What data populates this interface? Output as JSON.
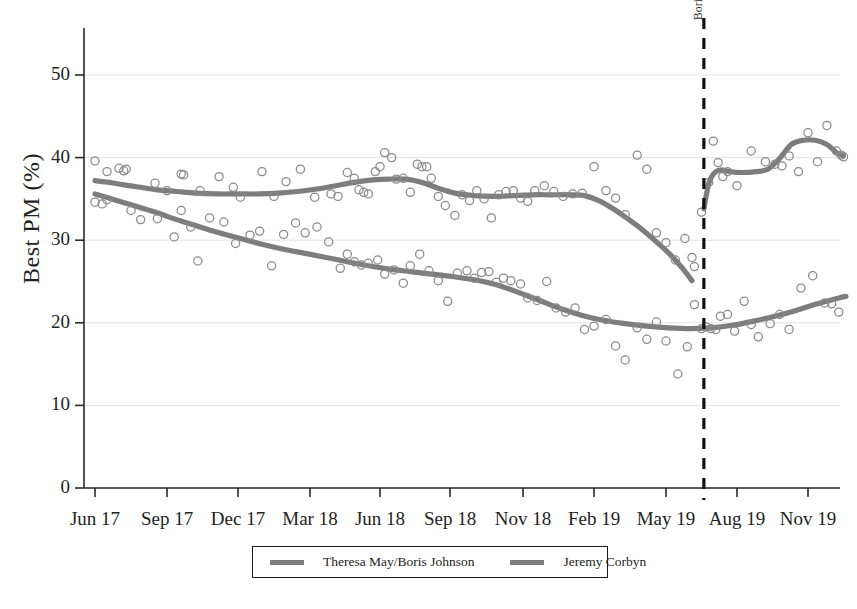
{
  "chart_data": {
    "type": "scatter",
    "title": "",
    "xlabel": "",
    "ylabel": "Best PM (%)",
    "ylim": [
      0,
      55
    ],
    "yticks": [
      0,
      10,
      20,
      30,
      40,
      50
    ],
    "ytick_labels": [
      "0",
      "10",
      "20",
      "30",
      "40",
      "50"
    ],
    "xtick_labels": [
      "Jun 17",
      "Sep 17",
      "Dec 17",
      "Mar 18",
      "Jun 18",
      "Sep 18",
      "Nov 18",
      "Feb 19",
      "May 19",
      "Aug 19",
      "Nov 19"
    ],
    "grid": true,
    "grid_axis": "y",
    "legend_position": "bottom-center",
    "annotations": [
      {
        "name": "boris-johnson-becomes-pm",
        "text": "Boris Johnson becomes PM",
        "type": "vertical-dashed-line",
        "x_label": "Jul 19",
        "x_value": 25.6,
        "color": "#111111",
        "style": "dashed"
      }
    ],
    "series": [
      {
        "name": "Theresa May/Boris Johnson",
        "color": "#7d7d7d",
        "marker": "open-circle",
        "line": "smoothed-trend",
        "trend": [
          {
            "x": 0.0,
            "y": 37.2
          },
          {
            "x": 0.6,
            "y": 37.0
          },
          {
            "x": 1.2,
            "y": 36.7
          },
          {
            "x": 1.9,
            "y": 36.4
          },
          {
            "x": 2.6,
            "y": 36.1
          },
          {
            "x": 3.4,
            "y": 35.9
          },
          {
            "x": 4.2,
            "y": 35.7
          },
          {
            "x": 5.1,
            "y": 35.6
          },
          {
            "x": 6.0,
            "y": 35.6
          },
          {
            "x": 6.9,
            "y": 35.6
          },
          {
            "x": 7.7,
            "y": 35.7
          },
          {
            "x": 8.5,
            "y": 35.9
          },
          {
            "x": 9.3,
            "y": 36.2
          },
          {
            "x": 10.1,
            "y": 36.6
          },
          {
            "x": 10.9,
            "y": 37.0
          },
          {
            "x": 11.7,
            "y": 37.3
          },
          {
            "x": 12.4,
            "y": 37.4
          },
          {
            "x": 13.1,
            "y": 37.4
          },
          {
            "x": 13.8,
            "y": 37.0
          },
          {
            "x": 14.5,
            "y": 36.3
          },
          {
            "x": 15.2,
            "y": 35.7
          },
          {
            "x": 16.0,
            "y": 35.4
          },
          {
            "x": 16.8,
            "y": 35.3
          },
          {
            "x": 17.6,
            "y": 35.4
          },
          {
            "x": 18.4,
            "y": 35.5
          },
          {
            "x": 19.2,
            "y": 35.5
          },
          {
            "x": 20.0,
            "y": 35.5
          },
          {
            "x": 20.6,
            "y": 35.4
          },
          {
            "x": 21.2,
            "y": 34.8
          },
          {
            "x": 21.8,
            "y": 33.8
          },
          {
            "x": 22.4,
            "y": 32.6
          },
          {
            "x": 23.0,
            "y": 31.3
          },
          {
            "x": 23.6,
            "y": 29.8
          },
          {
            "x": 24.2,
            "y": 28.2
          },
          {
            "x": 24.7,
            "y": 26.6
          },
          {
            "x": 25.1,
            "y": 25.1
          }
        ],
        "trend_post": [
          {
            "x": 25.6,
            "y": 33.8
          },
          {
            "x": 25.8,
            "y": 36.8
          },
          {
            "x": 26.0,
            "y": 38.0
          },
          {
            "x": 26.3,
            "y": 38.5
          },
          {
            "x": 26.7,
            "y": 38.3
          },
          {
            "x": 27.2,
            "y": 38.2
          },
          {
            "x": 27.8,
            "y": 38.3
          },
          {
            "x": 28.3,
            "y": 38.6
          },
          {
            "x": 28.8,
            "y": 39.9
          },
          {
            "x": 29.3,
            "y": 41.6
          },
          {
            "x": 29.8,
            "y": 42.1
          },
          {
            "x": 30.3,
            "y": 42.1
          },
          {
            "x": 30.8,
            "y": 41.6
          },
          {
            "x": 31.2,
            "y": 40.6
          },
          {
            "x": 31.5,
            "y": 40.2
          }
        ],
        "points": [
          {
            "x": 0.0,
            "y": 39.6
          },
          {
            "x": 0.5,
            "y": 38.3
          },
          {
            "x": 1.0,
            "y": 38.7
          },
          {
            "x": 1.2,
            "y": 38.4
          },
          {
            "x": 1.3,
            "y": 38.6
          },
          {
            "x": 2.5,
            "y": 36.9
          },
          {
            "x": 3.0,
            "y": 36.0
          },
          {
            "x": 3.6,
            "y": 38.0
          },
          {
            "x": 3.7,
            "y": 37.9
          },
          {
            "x": 4.4,
            "y": 36.0
          },
          {
            "x": 5.2,
            "y": 37.7
          },
          {
            "x": 5.8,
            "y": 36.4
          },
          {
            "x": 6.1,
            "y": 35.2
          },
          {
            "x": 7.0,
            "y": 38.3
          },
          {
            "x": 7.5,
            "y": 35.3
          },
          {
            "x": 8.0,
            "y": 37.1
          },
          {
            "x": 8.6,
            "y": 38.6
          },
          {
            "x": 9.2,
            "y": 35.2
          },
          {
            "x": 9.9,
            "y": 35.6
          },
          {
            "x": 10.2,
            "y": 35.3
          },
          {
            "x": 10.6,
            "y": 38.2
          },
          {
            "x": 10.9,
            "y": 37.5
          },
          {
            "x": 11.1,
            "y": 36.1
          },
          {
            "x": 11.3,
            "y": 35.8
          },
          {
            "x": 11.5,
            "y": 35.6
          },
          {
            "x": 11.8,
            "y": 38.3
          },
          {
            "x": 12.0,
            "y": 38.9
          },
          {
            "x": 12.2,
            "y": 40.6
          },
          {
            "x": 12.5,
            "y": 40.0
          },
          {
            "x": 12.7,
            "y": 37.4
          },
          {
            "x": 13.0,
            "y": 37.5
          },
          {
            "x": 13.3,
            "y": 35.8
          },
          {
            "x": 13.6,
            "y": 39.2
          },
          {
            "x": 13.8,
            "y": 38.9
          },
          {
            "x": 14.0,
            "y": 38.9
          },
          {
            "x": 14.2,
            "y": 37.5
          },
          {
            "x": 14.5,
            "y": 35.3
          },
          {
            "x": 14.8,
            "y": 34.2
          },
          {
            "x": 15.2,
            "y": 33.0
          },
          {
            "x": 15.5,
            "y": 35.5
          },
          {
            "x": 15.8,
            "y": 34.8
          },
          {
            "x": 16.1,
            "y": 36.0
          },
          {
            "x": 16.4,
            "y": 35.0
          },
          {
            "x": 16.7,
            "y": 32.7
          },
          {
            "x": 17.0,
            "y": 35.5
          },
          {
            "x": 17.3,
            "y": 35.9
          },
          {
            "x": 17.6,
            "y": 36.0
          },
          {
            "x": 17.9,
            "y": 35.1
          },
          {
            "x": 18.2,
            "y": 34.7
          },
          {
            "x": 18.5,
            "y": 36.0
          },
          {
            "x": 18.9,
            "y": 36.6
          },
          {
            "x": 19.3,
            "y": 35.9
          },
          {
            "x": 19.7,
            "y": 35.3
          },
          {
            "x": 20.1,
            "y": 35.6
          },
          {
            "x": 20.5,
            "y": 35.7
          },
          {
            "x": 21.0,
            "y": 38.9
          },
          {
            "x": 21.5,
            "y": 36.0
          },
          {
            "x": 21.9,
            "y": 35.1
          },
          {
            "x": 22.3,
            "y": 33.1
          },
          {
            "x": 22.8,
            "y": 40.3
          },
          {
            "x": 23.2,
            "y": 38.6
          },
          {
            "x": 23.6,
            "y": 30.9
          },
          {
            "x": 24.0,
            "y": 29.7
          },
          {
            "x": 24.4,
            "y": 27.6
          },
          {
            "x": 24.8,
            "y": 30.2
          },
          {
            "x": 25.1,
            "y": 27.9
          },
          {
            "x": 25.2,
            "y": 26.8
          },
          {
            "x": 25.5,
            "y": 33.4
          },
          {
            "x": 25.8,
            "y": 37.0
          },
          {
            "x": 26.0,
            "y": 42.0
          },
          {
            "x": 26.2,
            "y": 39.4
          },
          {
            "x": 26.4,
            "y": 37.7
          },
          {
            "x": 26.6,
            "y": 38.3
          },
          {
            "x": 27.0,
            "y": 36.6
          },
          {
            "x": 27.6,
            "y": 40.8
          },
          {
            "x": 28.2,
            "y": 39.5
          },
          {
            "x": 28.6,
            "y": 39.2
          },
          {
            "x": 28.9,
            "y": 39.0
          },
          {
            "x": 29.2,
            "y": 40.2
          },
          {
            "x": 29.6,
            "y": 38.3
          },
          {
            "x": 30.0,
            "y": 43.0
          },
          {
            "x": 30.4,
            "y": 39.5
          },
          {
            "x": 30.8,
            "y": 43.9
          },
          {
            "x": 31.2,
            "y": 40.8
          },
          {
            "x": 31.4,
            "y": 40.3
          },
          {
            "x": 31.5,
            "y": 40.1
          }
        ]
      },
      {
        "name": "Jeremy Corbyn",
        "color": "#7d7d7d",
        "marker": "open-circle",
        "line": "smoothed-trend",
        "trend": [
          {
            "x": 0.0,
            "y": 35.6
          },
          {
            "x": 0.8,
            "y": 34.9
          },
          {
            "x": 1.6,
            "y": 34.2
          },
          {
            "x": 2.5,
            "y": 33.4
          },
          {
            "x": 3.4,
            "y": 32.5
          },
          {
            "x": 4.3,
            "y": 31.7
          },
          {
            "x": 5.2,
            "y": 30.9
          },
          {
            "x": 6.1,
            "y": 30.2
          },
          {
            "x": 7.0,
            "y": 29.5
          },
          {
            "x": 7.9,
            "y": 28.9
          },
          {
            "x": 8.8,
            "y": 28.4
          },
          {
            "x": 9.7,
            "y": 27.9
          },
          {
            "x": 10.6,
            "y": 27.4
          },
          {
            "x": 11.5,
            "y": 26.9
          },
          {
            "x": 12.4,
            "y": 26.5
          },
          {
            "x": 13.3,
            "y": 26.2
          },
          {
            "x": 14.2,
            "y": 25.9
          },
          {
            "x": 15.1,
            "y": 25.6
          },
          {
            "x": 16.0,
            "y": 25.2
          },
          {
            "x": 16.9,
            "y": 24.6
          },
          {
            "x": 17.8,
            "y": 23.7
          },
          {
            "x": 18.7,
            "y": 22.7
          },
          {
            "x": 19.6,
            "y": 21.7
          },
          {
            "x": 20.5,
            "y": 20.9
          },
          {
            "x": 21.4,
            "y": 20.3
          },
          {
            "x": 22.3,
            "y": 19.9
          },
          {
            "x": 23.2,
            "y": 19.6
          },
          {
            "x": 24.1,
            "y": 19.4
          },
          {
            "x": 25.0,
            "y": 19.3
          },
          {
            "x": 25.9,
            "y": 19.4
          },
          {
            "x": 26.8,
            "y": 19.7
          },
          {
            "x": 27.7,
            "y": 20.2
          },
          {
            "x": 28.6,
            "y": 20.8
          },
          {
            "x": 29.5,
            "y": 21.5
          },
          {
            "x": 30.4,
            "y": 22.3
          },
          {
            "x": 31.3,
            "y": 23.0
          },
          {
            "x": 31.6,
            "y": 23.2
          }
        ],
        "points": [
          {
            "x": 0.0,
            "y": 34.6
          },
          {
            "x": 0.3,
            "y": 34.4
          },
          {
            "x": 0.5,
            "y": 34.9
          },
          {
            "x": 1.5,
            "y": 33.6
          },
          {
            "x": 1.9,
            "y": 32.5
          },
          {
            "x": 2.6,
            "y": 32.6
          },
          {
            "x": 3.3,
            "y": 30.4
          },
          {
            "x": 3.6,
            "y": 33.6
          },
          {
            "x": 4.0,
            "y": 31.6
          },
          {
            "x": 4.3,
            "y": 27.5
          },
          {
            "x": 4.8,
            "y": 32.7
          },
          {
            "x": 5.4,
            "y": 32.2
          },
          {
            "x": 5.9,
            "y": 29.6
          },
          {
            "x": 6.5,
            "y": 30.6
          },
          {
            "x": 6.9,
            "y": 31.1
          },
          {
            "x": 7.4,
            "y": 26.9
          },
          {
            "x": 7.9,
            "y": 30.7
          },
          {
            "x": 8.4,
            "y": 32.1
          },
          {
            "x": 8.8,
            "y": 30.9
          },
          {
            "x": 9.3,
            "y": 31.6
          },
          {
            "x": 9.8,
            "y": 29.8
          },
          {
            "x": 10.3,
            "y": 26.6
          },
          {
            "x": 10.6,
            "y": 28.3
          },
          {
            "x": 10.9,
            "y": 27.4
          },
          {
            "x": 11.2,
            "y": 27.0
          },
          {
            "x": 11.5,
            "y": 27.2
          },
          {
            "x": 11.9,
            "y": 27.6
          },
          {
            "x": 12.2,
            "y": 25.9
          },
          {
            "x": 12.6,
            "y": 26.4
          },
          {
            "x": 13.0,
            "y": 24.8
          },
          {
            "x": 13.3,
            "y": 26.9
          },
          {
            "x": 13.7,
            "y": 28.3
          },
          {
            "x": 14.1,
            "y": 26.3
          },
          {
            "x": 14.5,
            "y": 25.1
          },
          {
            "x": 14.9,
            "y": 22.6
          },
          {
            "x": 15.3,
            "y": 26.0
          },
          {
            "x": 15.7,
            "y": 26.3
          },
          {
            "x": 16.0,
            "y": 25.4
          },
          {
            "x": 16.3,
            "y": 26.1
          },
          {
            "x": 16.6,
            "y": 26.2
          },
          {
            "x": 16.9,
            "y": 24.9
          },
          {
            "x": 17.2,
            "y": 25.4
          },
          {
            "x": 17.5,
            "y": 25.1
          },
          {
            "x": 17.9,
            "y": 24.7
          },
          {
            "x": 18.2,
            "y": 23.0
          },
          {
            "x": 18.6,
            "y": 22.7
          },
          {
            "x": 19.0,
            "y": 25.0
          },
          {
            "x": 19.4,
            "y": 21.8
          },
          {
            "x": 19.8,
            "y": 21.3
          },
          {
            "x": 20.2,
            "y": 21.8
          },
          {
            "x": 20.6,
            "y": 19.2
          },
          {
            "x": 21.0,
            "y": 19.6
          },
          {
            "x": 21.5,
            "y": 20.4
          },
          {
            "x": 21.9,
            "y": 17.2
          },
          {
            "x": 22.3,
            "y": 15.5
          },
          {
            "x": 22.8,
            "y": 19.4
          },
          {
            "x": 23.2,
            "y": 18.0
          },
          {
            "x": 23.6,
            "y": 20.1
          },
          {
            "x": 24.0,
            "y": 17.8
          },
          {
            "x": 24.5,
            "y": 13.8
          },
          {
            "x": 24.9,
            "y": 17.1
          },
          {
            "x": 25.2,
            "y": 22.2
          },
          {
            "x": 25.5,
            "y": 19.3
          },
          {
            "x": 25.7,
            "y": 19.5
          },
          {
            "x": 25.9,
            "y": 19.3
          },
          {
            "x": 26.1,
            "y": 19.2
          },
          {
            "x": 26.3,
            "y": 20.8
          },
          {
            "x": 26.6,
            "y": 21.0
          },
          {
            "x": 26.9,
            "y": 19.0
          },
          {
            "x": 27.3,
            "y": 22.6
          },
          {
            "x": 27.6,
            "y": 19.8
          },
          {
            "x": 27.9,
            "y": 18.3
          },
          {
            "x": 28.4,
            "y": 19.9
          },
          {
            "x": 28.8,
            "y": 21.0
          },
          {
            "x": 29.2,
            "y": 19.2
          },
          {
            "x": 29.7,
            "y": 24.2
          },
          {
            "x": 30.2,
            "y": 25.7
          },
          {
            "x": 30.7,
            "y": 22.4
          },
          {
            "x": 31.0,
            "y": 22.3
          },
          {
            "x": 31.3,
            "y": 21.3
          }
        ]
      }
    ]
  },
  "legend": {
    "items": [
      {
        "label": "Theresa May/Boris Johnson",
        "color": "#7d7d7d"
      },
      {
        "label": "Jeremy Corbyn",
        "color": "#7d7d7d"
      }
    ]
  }
}
